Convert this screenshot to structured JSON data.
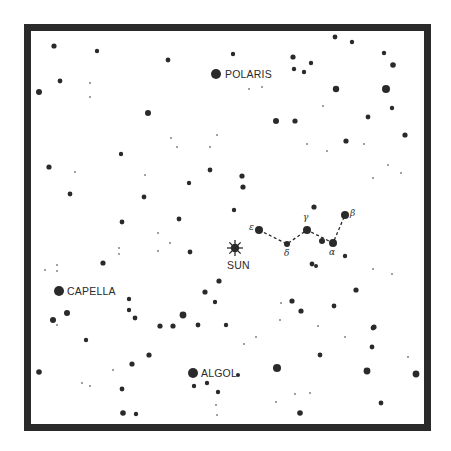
{
  "chart_data": {
    "type": "scatter",
    "title": "",
    "xlabel": "",
    "ylabel": "",
    "grid": false,
    "colors": {
      "ink": "#2a2a2a",
      "background": "#ffffff"
    },
    "named_stars": [
      {
        "name": "POLARIS",
        "x": 216,
        "y": 74,
        "r": 5
      },
      {
        "name": "CAPELLA",
        "x": 59,
        "y": 291,
        "r": 5
      },
      {
        "name": "ALGOL",
        "x": 193,
        "y": 373,
        "r": 5
      }
    ],
    "sun": {
      "label": "SUN",
      "x": 235,
      "y": 248
    },
    "constellation": {
      "line_style": "dashed",
      "stars": [
        {
          "label": "ε",
          "x": 259,
          "y": 230,
          "r": 4
        },
        {
          "label": "δ",
          "x": 287,
          "y": 244,
          "r": 3
        },
        {
          "label": "γ",
          "x": 307,
          "y": 230,
          "r": 4
        },
        {
          "label": "",
          "x": 322,
          "y": 241,
          "r": 3
        },
        {
          "label": "α",
          "x": 333,
          "y": 243,
          "r": 4
        },
        {
          "label": "β",
          "x": 345,
          "y": 215,
          "r": 4
        }
      ],
      "path": [
        [
          259,
          230
        ],
        [
          287,
          244
        ],
        [
          307,
          230
        ],
        [
          333,
          243
        ],
        [
          345,
          215
        ]
      ]
    },
    "stars": [
      [
        54,
        46,
        2.6
      ],
      [
        97,
        51,
        2.2
      ],
      [
        168,
        60,
        2.4
      ],
      [
        60,
        81,
        2.4
      ],
      [
        39,
        92,
        3
      ],
      [
        148,
        113,
        3
      ],
      [
        335,
        37,
        2.4
      ],
      [
        352,
        42,
        2.2
      ],
      [
        233,
        54,
        2.2
      ],
      [
        293,
        57,
        2.6
      ],
      [
        311,
        63,
        2.2
      ],
      [
        294,
        69,
        2.2
      ],
      [
        384,
        53,
        2.2
      ],
      [
        393,
        65,
        2.8
      ],
      [
        304,
        72,
        2.2
      ],
      [
        336,
        89,
        3.2
      ],
      [
        386,
        89,
        4
      ],
      [
        392,
        108,
        2.2
      ],
      [
        276,
        121,
        3
      ],
      [
        295,
        121,
        2.6
      ],
      [
        368,
        117,
        2.4
      ],
      [
        121,
        154,
        2.2
      ],
      [
        49,
        167,
        2.6
      ],
      [
        70,
        194,
        2.4
      ],
      [
        189,
        183,
        2.2
      ],
      [
        210,
        170,
        2.4
      ],
      [
        144,
        197,
        2.4
      ],
      [
        179,
        219,
        2.4
      ],
      [
        122,
        222,
        2.4
      ],
      [
        346,
        141,
        2.6
      ],
      [
        405,
        135,
        2.6
      ],
      [
        242,
        176,
        2.6
      ],
      [
        243,
        187,
        2.6
      ],
      [
        314,
        207,
        2.6
      ],
      [
        234,
        210,
        2.2
      ],
      [
        316,
        266,
        2
      ],
      [
        190,
        252,
        2.4
      ],
      [
        103,
        263,
        2.6
      ],
      [
        219,
        281,
        2.6
      ],
      [
        205,
        292,
        2.6
      ],
      [
        215,
        302,
        2.2
      ],
      [
        129,
        299,
        2.2
      ],
      [
        67,
        313,
        3
      ],
      [
        53,
        320,
        3
      ],
      [
        183,
        315,
        3.4
      ],
      [
        129,
        310,
        2.2
      ],
      [
        135,
        318,
        2.4
      ],
      [
        160,
        326,
        2.6
      ],
      [
        173,
        326,
        2.6
      ],
      [
        198,
        325,
        2.4
      ],
      [
        345,
        256,
        2.2
      ],
      [
        312,
        264,
        2.4
      ],
      [
        356,
        290,
        2.6
      ],
      [
        292,
        301,
        2.6
      ],
      [
        301,
        311,
        2.6
      ],
      [
        334,
        306,
        2.4
      ],
      [
        374,
        327,
        2.6
      ],
      [
        86,
        340,
        2.2
      ],
      [
        149,
        355,
        2.6
      ],
      [
        132,
        364,
        2.6
      ],
      [
        39,
        372,
        2.8
      ],
      [
        122,
        389,
        2.4
      ],
      [
        194,
        386,
        2.2
      ],
      [
        207,
        383,
        2.2
      ],
      [
        218,
        392,
        2.2
      ],
      [
        123,
        413,
        2.8
      ],
      [
        136,
        414,
        2.2
      ],
      [
        226,
        325,
        2.2
      ],
      [
        373,
        328,
        2.4
      ],
      [
        372,
        347,
        2.4
      ],
      [
        320,
        355,
        2.4
      ],
      [
        277,
        368,
        4
      ],
      [
        367,
        371,
        3.4
      ],
      [
        416,
        374,
        3.4
      ],
      [
        381,
        403,
        2.4
      ],
      [
        300,
        413,
        2.8
      ],
      [
        238,
        375,
        2
      ]
    ],
    "faint_stars": [
      [
        90,
        83
      ],
      [
        90,
        97
      ],
      [
        249,
        89
      ],
      [
        262,
        87
      ],
      [
        323,
        106
      ],
      [
        171,
        138
      ],
      [
        177,
        147
      ],
      [
        210,
        147
      ],
      [
        217,
        135
      ],
      [
        75,
        172
      ],
      [
        145,
        175
      ],
      [
        307,
        144
      ],
      [
        327,
        151
      ],
      [
        364,
        144
      ],
      [
        388,
        165
      ],
      [
        373,
        178
      ],
      [
        401,
        173
      ],
      [
        57,
        265
      ],
      [
        45,
        270
      ],
      [
        57,
        271
      ],
      [
        119,
        248
      ],
      [
        119,
        254
      ],
      [
        158,
        233
      ],
      [
        170,
        243
      ],
      [
        158,
        251
      ],
      [
        373,
        269
      ],
      [
        392,
        274
      ],
      [
        281,
        303
      ],
      [
        280,
        320
      ],
      [
        318,
        326
      ],
      [
        256,
        337
      ],
      [
        244,
        344
      ],
      [
        345,
        337
      ],
      [
        113,
        370
      ],
      [
        82,
        383
      ],
      [
        90,
        386
      ],
      [
        217,
        415
      ],
      [
        57,
        325
      ],
      [
        408,
        357
      ],
      [
        295,
        394
      ],
      [
        310,
        393
      ],
      [
        276,
        402
      ],
      [
        216,
        405
      ]
    ]
  },
  "labels": {
    "polaris": "POLARIS",
    "capella": "CAPELLA",
    "algol": "ALGOL",
    "sun": "SUN",
    "epsilon": "ε",
    "delta": "δ",
    "gamma": "γ",
    "alpha": "α",
    "beta": "β"
  }
}
